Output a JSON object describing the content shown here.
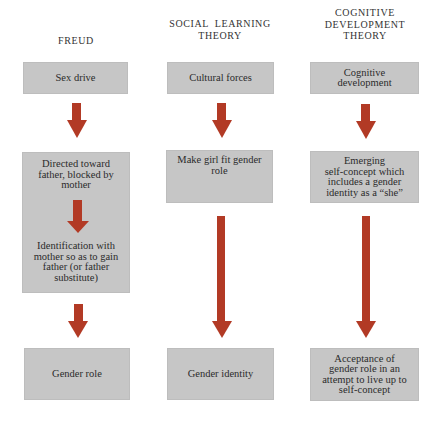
{
  "columns": [
    {
      "id": "freud",
      "header": [
        "FREUD"
      ],
      "steps": [
        {
          "lines": [
            "Sex drive"
          ]
        },
        {
          "lines": [
            "Directed toward",
            "father, blocked by",
            "mother"
          ]
        },
        {
          "lines": [
            "Identification with",
            "mother so as to gain",
            "father (or father",
            "substitute)"
          ]
        },
        {
          "lines": [
            "Gender role"
          ]
        }
      ]
    },
    {
      "id": "social-learning",
      "header": [
        "SOCIAL  LEARNING",
        "THEORY"
      ],
      "steps": [
        {
          "lines": [
            "Cultural forces"
          ]
        },
        {
          "lines": [
            "Make girl fit gender",
            "role"
          ]
        },
        {
          "lines": [
            "Gender identity"
          ]
        }
      ]
    },
    {
      "id": "cognitive-development",
      "header": [
        "COGNITIVE",
        "DEVELOPMENT",
        "THEORY"
      ],
      "steps": [
        {
          "lines": [
            "Cognitive",
            "development"
          ]
        },
        {
          "lines": [
            "Emerging",
            "self-concept which",
            "includes a gender",
            "identity as a “she”"
          ]
        },
        {
          "lines": [
            "Acceptance of",
            "gender role in an",
            "attempt to live up to",
            "self-concept"
          ]
        }
      ]
    }
  ],
  "colors": {
    "box_fill": "#c6c6c6",
    "arrow": "#b23a25",
    "text": "#2b2b2b",
    "background": "#ffffff"
  }
}
